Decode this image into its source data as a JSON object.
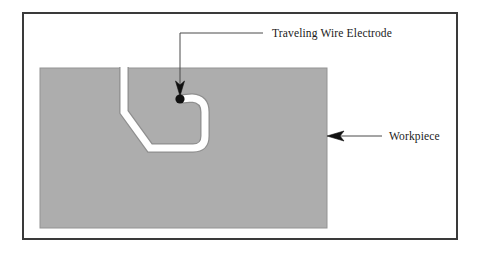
{
  "figure": {
    "background_color": "#ffffff",
    "frame": {
      "name": "outer-border",
      "color": "#3a3a3a",
      "x": 22,
      "y": 12,
      "width": 436,
      "height": 228,
      "stroke_width": 2
    }
  },
  "workpiece": {
    "label": "Workpiece",
    "fill_color": "#adadad",
    "edge_color": "#8a8a8a",
    "x": 40,
    "y": 68,
    "width": 287,
    "height": 160
  },
  "wire_channel": {
    "label": "Traveling Wire Electrode",
    "kerf_color": "#ffffff",
    "kerf_width": 7,
    "edge_color": "#8f8f8f",
    "path_points": [
      [
        124,
        68
      ],
      [
        124,
        112
      ],
      [
        150,
        148
      ],
      [
        193,
        148
      ],
      [
        205,
        137
      ],
      [
        205,
        110
      ],
      [
        191,
        98
      ],
      [
        181,
        99
      ]
    ]
  },
  "electrode": {
    "label": "Traveling Wire Electrode",
    "dot_color": "#111111",
    "dot_x": 180,
    "dot_y": 99,
    "dot_radius": 4.5
  },
  "leaders": {
    "electrode": {
      "label": "Traveling Wire Electrode",
      "line_color": "#4a4a4a",
      "text_x": 272,
      "text_y": 37,
      "elbow_x": 180,
      "elbow_y": 33,
      "text_anchor_x": 263,
      "arrow_tip_x": 180,
      "arrow_tip_y": 92
    },
    "workpiece": {
      "label": "Workpiece",
      "line_color": "#4a4a4a",
      "text_x": 389,
      "text_y": 140,
      "line_start_x": 380,
      "line_y": 136,
      "arrow_tip_x": 327
    }
  }
}
